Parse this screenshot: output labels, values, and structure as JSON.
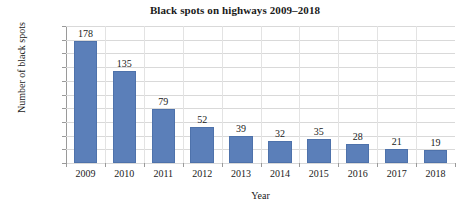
{
  "chart_data": {
    "type": "bar",
    "title": "Black spots on highways 2009–2018",
    "xlabel": "Year",
    "ylabel": "Number of black spots",
    "categories": [
      "2009",
      "2010",
      "2011",
      "2012",
      "2013",
      "2014",
      "2015",
      "2016",
      "2017",
      "2018"
    ],
    "values": [
      178,
      135,
      79,
      52,
      39,
      32,
      35,
      28,
      21,
      19
    ],
    "ylim": [
      0,
      200
    ],
    "ytick_step": 20,
    "yticks": [
      200,
      180,
      160,
      140,
      120,
      100,
      80,
      60,
      40,
      20,
      0
    ],
    "grid": true,
    "legend": "none",
    "bar_color": "#5b7fb9",
    "gridline_color": "#d9d9d9",
    "axis_color": "#9a9a9a",
    "background": "#ffffff",
    "data_labels": [
      "178",
      "135",
      "79",
      "52",
      "39",
      "32",
      "35",
      "28",
      "21",
      "19"
    ]
  }
}
